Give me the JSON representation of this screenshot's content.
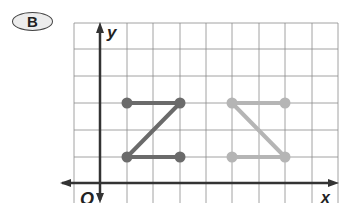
{
  "badge": {
    "label": "B"
  },
  "axes": {
    "x_label": "x",
    "y_label": "y",
    "origin_label": "O"
  },
  "grid": {
    "x_lines": [
      74,
      100,
      127,
      153,
      180,
      206,
      232,
      259,
      285,
      312,
      338
    ],
    "y_lines": [
      23,
      49,
      76,
      103,
      130,
      157,
      183
    ],
    "color": "#8a8a8a"
  },
  "figures": [
    {
      "name": "dark-z-figure",
      "color": "#6b6b6b",
      "points": [
        [
          1,
          3
        ],
        [
          3,
          3
        ],
        [
          1,
          1
        ],
        [
          3,
          1
        ]
      ],
      "segments": [
        [
          [
            127,
            103
          ],
          [
            180,
            103
          ]
        ],
        [
          [
            180,
            103
          ],
          [
            127,
            157
          ]
        ],
        [
          [
            127,
            157
          ],
          [
            180,
            157
          ]
        ]
      ],
      "dots": [
        [
          127,
          103
        ],
        [
          180,
          103
        ],
        [
          127,
          157
        ],
        [
          180,
          157
        ]
      ]
    },
    {
      "name": "light-reflected-figure",
      "color": "#b5b5b5",
      "points": [
        [
          5,
          3
        ],
        [
          7,
          3
        ],
        [
          5,
          1
        ],
        [
          7,
          1
        ]
      ],
      "segments": [
        [
          [
            232,
            103
          ],
          [
            285,
            103
          ]
        ],
        [
          [
            232,
            103
          ],
          [
            285,
            157
          ]
        ],
        [
          [
            232,
            157
          ],
          [
            285,
            157
          ]
        ]
      ],
      "dots": [
        [
          232,
          103
        ],
        [
          285,
          103
        ],
        [
          232,
          157
        ],
        [
          285,
          157
        ]
      ]
    }
  ]
}
